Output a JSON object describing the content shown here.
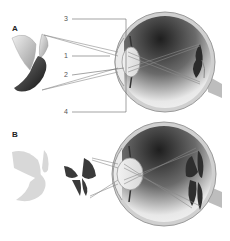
{
  "diagram": {
    "panels": [
      {
        "id": "A",
        "letter": "A",
        "object": "dove-in-focus",
        "image_on_retina": "inverted dove"
      },
      {
        "id": "B",
        "letter": "B",
        "object": "butterfly-in-focus",
        "background_object": "blurred dove",
        "image_on_retina": "inverted butterfly"
      }
    ],
    "labels": [
      {
        "num": "3",
        "target": "eyeball outer wall / sclera (bracket top)"
      },
      {
        "num": "1",
        "target": "cornea"
      },
      {
        "num": "2",
        "target": "lens"
      },
      {
        "num": "4",
        "target": "eyeball outer wall (bracket bottom)"
      }
    ],
    "colors": {
      "line": "#777777",
      "eye_shell": "#c8c8c8",
      "eye_dark": "#2a2a2a",
      "dove_wing": "#e4e4e4",
      "dove_body": "#333333",
      "blurred_dove": "#d6d6d6"
    }
  }
}
